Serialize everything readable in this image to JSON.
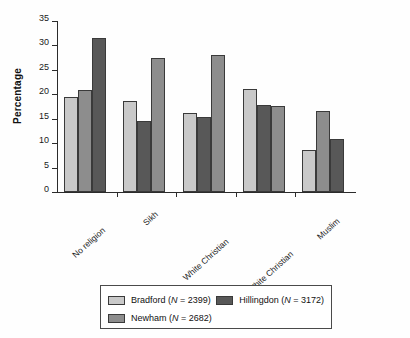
{
  "chart_data": {
    "type": "bar",
    "title": "",
    "subtitle": "",
    "xlabel": "",
    "ylabel": "Percentage",
    "ylim": [
      0,
      35
    ],
    "yticks": [
      0,
      5,
      10,
      15,
      20,
      25,
      30,
      35
    ],
    "ytick_labels": [
      "0",
      "5",
      "10",
      "15",
      "20",
      "25",
      "30",
      "35"
    ],
    "grid": false,
    "legend_position": "bottom",
    "categories": [
      "No religion",
      "Sikh",
      "White Christian",
      "Non-White Christian",
      "Muslim"
    ],
    "series": [
      {
        "name": "Bradford",
        "n": 2399,
        "legend_label": "Bradford (N = 2399)",
        "color": "#c9c9c9",
        "values": [
          19.4,
          18.6,
          16.2,
          21.0,
          8.7
        ]
      },
      {
        "name": "Newham",
        "n": 2682,
        "legend_label": "Newham (N = 2682)",
        "color": "#8d8d8d",
        "values": [
          20.8,
          27.5,
          28.1,
          17.6,
          16.6
        ]
      },
      {
        "name": "Hillingdon",
        "n": 3172,
        "legend_label": "Hillingdon (N = 3172)",
        "color": "#585858",
        "values": [
          31.6,
          14.5,
          15.3,
          17.8,
          10.8
        ]
      }
    ],
    "bar_draw_order": [
      [
        "Bradford",
        "Newham",
        "Hillingdon"
      ],
      [
        "Bradford",
        "Hillingdon",
        "Newham"
      ],
      [
        "Bradford",
        "Hillingdon",
        "Newham"
      ],
      [
        "Bradford",
        "Hillingdon",
        "Newham"
      ],
      [
        "Bradford",
        "Newham",
        "Hillingdon"
      ]
    ],
    "annotations": []
  },
  "axis": {
    "ytitle": "Percentage"
  },
  "legend": {
    "entries": [
      {
        "label": "Bradford (N = 2399)",
        "name": "Bradford",
        "n": "2399",
        "swatch": "#c9c9c9"
      },
      {
        "label": "Hillingdon (N = 3172)",
        "name": "Hillingdon",
        "n": "3172",
        "swatch": "#585858"
      },
      {
        "label": "Newham (N = 2682)",
        "name": "Newham",
        "n": "2682",
        "swatch": "#8d8d8d"
      }
    ]
  }
}
